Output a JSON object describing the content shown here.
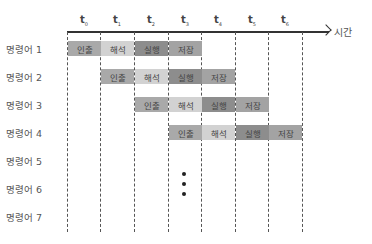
{
  "diagram": {
    "type": "instruction-pipeline",
    "axis": {
      "label": "시간"
    },
    "ticks": [
      {
        "base": "t",
        "sub": "0"
      },
      {
        "base": "t",
        "sub": "1"
      },
      {
        "base": "t",
        "sub": "2"
      },
      {
        "base": "t",
        "sub": "3"
      },
      {
        "base": "t",
        "sub": "4"
      },
      {
        "base": "t",
        "sub": "5"
      },
      {
        "base": "t",
        "sub": "6"
      }
    ],
    "stages": {
      "fetch": {
        "label": "인출",
        "color": "#a9a9a9"
      },
      "decode": {
        "label": "해석",
        "color": "#d2d2d2"
      },
      "execute": {
        "label": "실행",
        "color": "#8d8d8d"
      },
      "store": {
        "label": "저장",
        "color": "#a3a3a3"
      }
    },
    "rows": [
      {
        "label": "명령어 1",
        "start": 0
      },
      {
        "label": "명령어 2",
        "start": 1
      },
      {
        "label": "명령어 3",
        "start": 2
      },
      {
        "label": "명령어 4",
        "start": 3
      },
      {
        "label": "명령어 5",
        "start": null
      },
      {
        "label": "명령어 6",
        "start": null
      },
      {
        "label": "명령어 7",
        "start": null
      }
    ],
    "ellipsis": "⋮"
  }
}
